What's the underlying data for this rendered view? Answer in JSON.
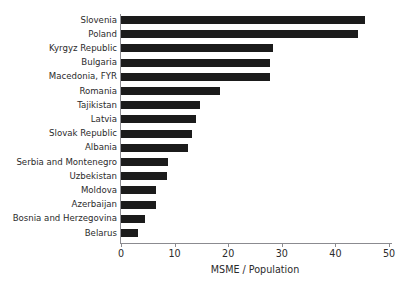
{
  "chart": {
    "title_remnant": "",
    "xaxis_title": "MSME / Population"
  },
  "chart_data": {
    "type": "bar",
    "orientation": "horizontal",
    "title": "",
    "xlabel": "MSME / Population",
    "ylabel": "",
    "xlim": [
      0,
      52
    ],
    "xticks": [
      0,
      10,
      20,
      30,
      40,
      50
    ],
    "xtick_labels": [
      "0",
      "10",
      "20",
      "30",
      "40",
      "50"
    ],
    "grid": false,
    "legend": null,
    "bar_color": "#1b1b1b",
    "axis_color": "#8b8b90",
    "text_color": "#2b2b2b",
    "categories": [
      "Slovenia",
      "Poland",
      "Kyrgyz Republic",
      "Bulgaria",
      "Macedonia, FYR",
      "Romania",
      "Tajikistan",
      "Latvia",
      "Slovak Republic",
      "Albania",
      "Serbia and Montenegro",
      "Uzbekistan",
      "Moldova",
      "Azerbaijan",
      "Bosnia and Herzegovina",
      "Belarus"
    ],
    "values": [
      45.5,
      44.2,
      28.4,
      27.8,
      27.8,
      18.5,
      14.7,
      14.0,
      13.2,
      12.5,
      8.8,
      8.6,
      6.5,
      6.5,
      4.5,
      3.2
    ]
  }
}
